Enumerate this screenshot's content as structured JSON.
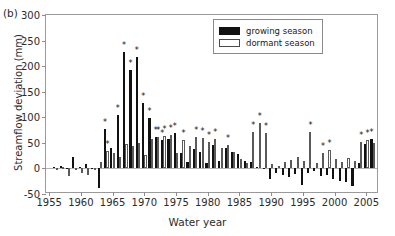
{
  "figure": {
    "panel_label": "(b)",
    "xlabel": "Water year",
    "ylabel": "Streamflow deviation (mm)"
  },
  "legend": {
    "position": "top-right",
    "entries": [
      {
        "label": "growing season",
        "color": "#111111",
        "style": "filled"
      },
      {
        "label": "dormant season",
        "color": "#ffffff",
        "style": "open"
      }
    ]
  },
  "axes": {
    "y_ticks": [
      -50,
      0,
      50,
      100,
      150,
      200,
      250,
      300
    ],
    "y_tick_labels": [
      "-50",
      "0",
      "50",
      "100",
      "150",
      "200",
      "250",
      "300"
    ],
    "x_ticks": [
      1955,
      1960,
      1965,
      1970,
      1975,
      1980,
      1985,
      1990,
      1995,
      2000,
      2005
    ],
    "x_tick_labels": [
      "1955",
      "1960",
      "1965",
      "1970",
      "1975",
      "1980",
      "1985",
      "1990",
      "1995",
      "2000",
      "2005"
    ],
    "ylim": [
      -50,
      300
    ],
    "xlim": [
      1954.5,
      2007.0
    ],
    "grid": false
  },
  "chart_data": {
    "type": "bar",
    "title": "",
    "subtitle": "",
    "xlabel": "Water year",
    "ylabel": "Streamflow deviation (mm)",
    "ylim": [
      -50,
      300
    ],
    "xlim": [
      1954.5,
      2007.0
    ],
    "grid": false,
    "legend_position": "top-right",
    "annotation_note": "Asterisks (*) mark statistically significant deviations",
    "categories": [
      1956,
      1957,
      1958,
      1959,
      1960,
      1961,
      1962,
      1963,
      1964,
      1965,
      1966,
      1967,
      1968,
      1969,
      1970,
      1971,
      1972,
      1973,
      1974,
      1975,
      1976,
      1977,
      1978,
      1979,
      1980,
      1981,
      1982,
      1983,
      1984,
      1985,
      1986,
      1987,
      1988,
      1989,
      1990,
      1991,
      1992,
      1993,
      1994,
      1995,
      1996,
      1997,
      1998,
      1999,
      2000,
      2001,
      2002,
      2003,
      2004,
      2005,
      2006
    ],
    "series": [
      {
        "name": "growing season",
        "color": "#111111",
        "values": [
          2,
          4,
          -2,
          22,
          3,
          9,
          1,
          -38,
          78,
          40,
          105,
          228,
          193,
          218,
          128,
          98,
          62,
          56,
          58,
          70,
          30,
          12,
          38,
          33,
          10,
          45,
          14,
          40,
          32,
          28,
          14,
          12,
          3,
          -2,
          -20,
          -8,
          -12,
          -16,
          -10,
          -32,
          -8,
          -6,
          -14,
          -12,
          -20,
          -24,
          -26,
          -34,
          10,
          48,
          58
        ],
        "significant": [
          false,
          false,
          false,
          false,
          false,
          false,
          false,
          false,
          true,
          false,
          true,
          true,
          true,
          true,
          true,
          true,
          true,
          true,
          false,
          true,
          false,
          false,
          false,
          false,
          false,
          false,
          false,
          false,
          false,
          false,
          false,
          false,
          false,
          false,
          false,
          false,
          false,
          false,
          false,
          false,
          false,
          false,
          false,
          false,
          false,
          false,
          false,
          false,
          false,
          false,
          true
        ]
      },
      {
        "name": "dormant season",
        "color": "#ffffff",
        "values": [
          1,
          2,
          -14,
          -4,
          -8,
          -12,
          -3,
          13,
          35,
          30,
          22,
          48,
          44,
          50,
          26,
          58,
          62,
          64,
          66,
          30,
          55,
          44,
          62,
          60,
          52,
          58,
          40,
          45,
          32,
          18,
          10,
          72,
          88,
          70,
          8,
          5,
          12,
          16,
          22,
          14,
          72,
          10,
          30,
          36,
          18,
          12,
          20,
          14,
          52,
          56,
          50
        ],
        "significant": [
          false,
          false,
          false,
          false,
          false,
          false,
          false,
          false,
          true,
          false,
          false,
          false,
          false,
          false,
          false,
          false,
          true,
          true,
          true,
          false,
          true,
          false,
          true,
          true,
          true,
          true,
          false,
          true,
          false,
          false,
          false,
          true,
          true,
          true,
          false,
          false,
          false,
          false,
          false,
          false,
          true,
          false,
          true,
          true,
          false,
          false,
          false,
          false,
          true,
          true,
          false
        ]
      }
    ]
  }
}
